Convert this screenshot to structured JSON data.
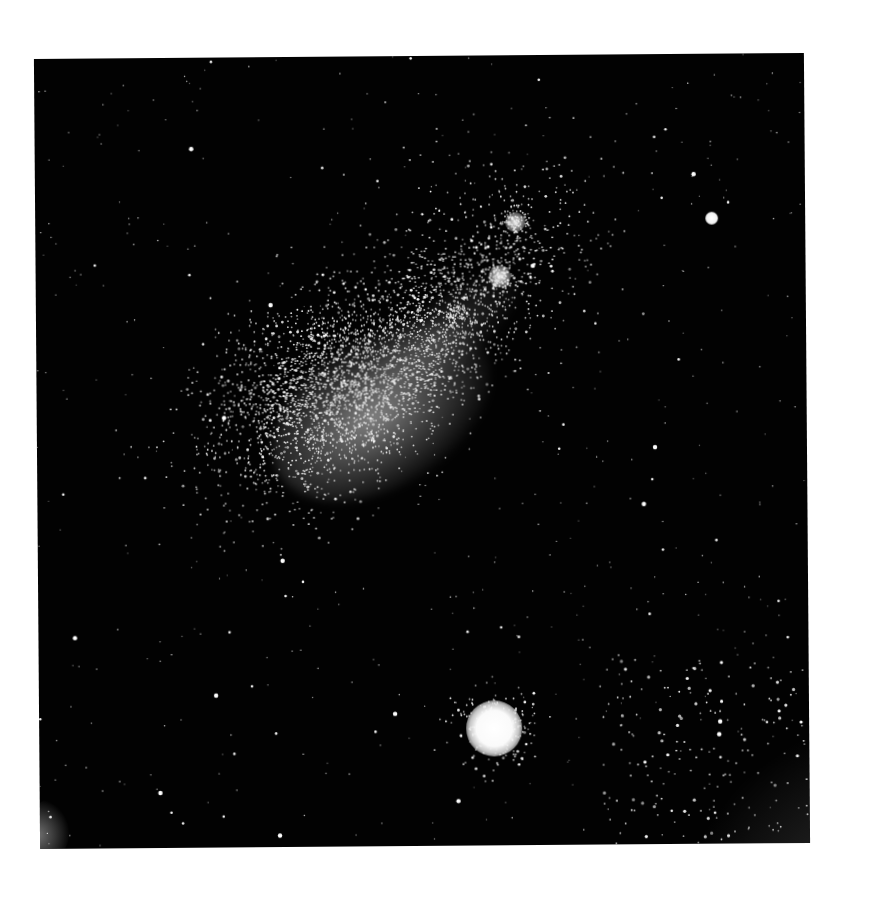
{
  "image": {
    "subject": "Astronomical photographic plate: Small Magellanic Cloud with globular cluster",
    "background_color": "#ffffff",
    "plate_color": "#020202",
    "star_color": "#ffffff"
  },
  "features": [
    {
      "name": "smc-main-body",
      "center": [
        330,
        395
      ],
      "note": "dense diffuse star cloud"
    },
    {
      "name": "smc-wing-clusters",
      "centers": [
        [
          516,
          224
        ],
        [
          500,
          278
        ],
        [
          455,
          315
        ]
      ]
    },
    {
      "name": "globular-cluster",
      "center": [
        490,
        727
      ],
      "radius": 25
    },
    {
      "name": "isolated-bright-star",
      "center": [
        715,
        221
      ],
      "radius": 6
    }
  ],
  "starfield": {
    "seed": 7,
    "background_count": 520,
    "cloud_count": 2600,
    "cloud_center": [
      300,
      330
    ],
    "cloud_spread": [
      70,
      45
    ],
    "cloud_angle_deg": -33,
    "bar_count": 900,
    "bar_center": [
      405,
      270
    ],
    "bar_spread": [
      85,
      28
    ]
  }
}
